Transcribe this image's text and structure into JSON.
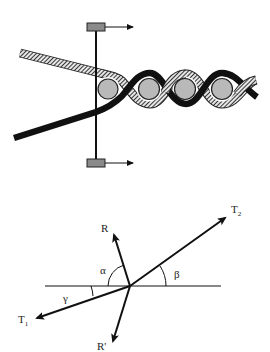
{
  "figure": {
    "top_panel": {
      "description": "Twisted strand pair wrapped around spheres, pulled by a vertical rod with two sliders",
      "slider_arrow_direction": "right",
      "sphere_count": 4,
      "colors": {
        "dark_strand": "#111111",
        "hatched_strand": "#555555",
        "sphere_fill": "#b8b8b8",
        "slider_fill": "#8a8a8a"
      }
    },
    "bottom_panel": {
      "description": "Force vector diagram with angles",
      "vectors": {
        "R": "R",
        "R_prime": "R'",
        "T1_main": "T",
        "T1_sub": "1",
        "T2_main": "T",
        "T2_sub": "2"
      },
      "angles": {
        "alpha": "α",
        "beta": "β",
        "gamma": "γ"
      }
    }
  }
}
